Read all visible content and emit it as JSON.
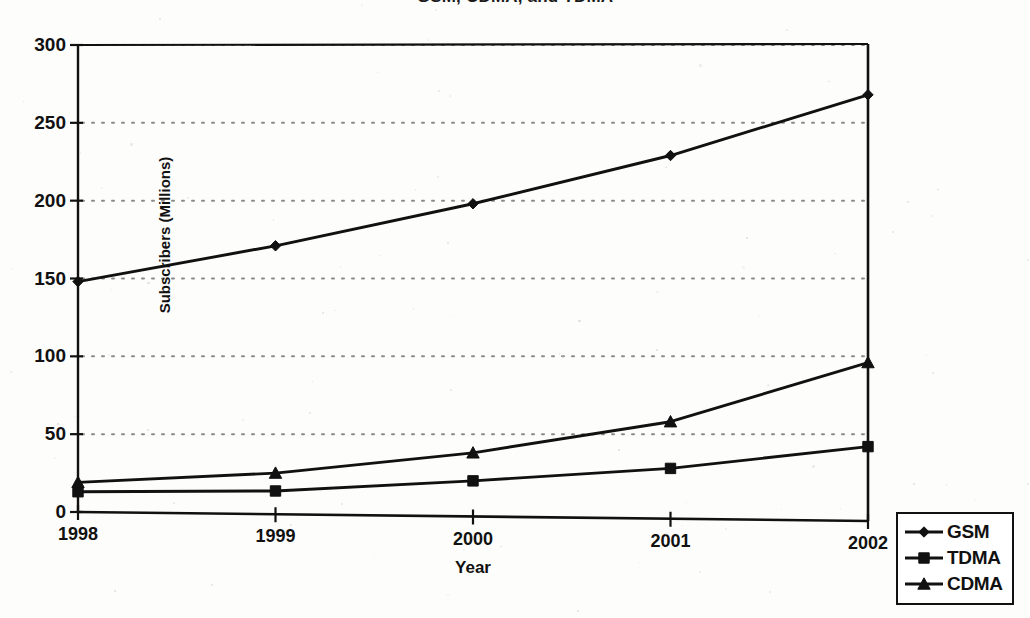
{
  "chart_data": {
    "type": "line",
    "title": "GSM, CDMA, and TDMA",
    "title_note": "clipped-top",
    "xlabel": "Year",
    "ylabel": "Subscribers (Millions)",
    "categories": [
      "1998",
      "1999",
      "2000",
      "2001",
      "2002"
    ],
    "x": [
      1998,
      1999,
      2000,
      2001,
      2002
    ],
    "xlim": [
      1998,
      2002
    ],
    "ylim": [
      0,
      300
    ],
    "yticks": [
      0,
      50,
      100,
      150,
      200,
      250,
      300
    ],
    "ytick_labels": [
      "0",
      "50",
      "100",
      "150",
      "200",
      "250",
      "300"
    ],
    "grid": "horizontal-dotted",
    "legend_position": "bottom-right-outside",
    "series": [
      {
        "name": "GSM",
        "marker": "diamond",
        "values": [
          148,
          171,
          198,
          229,
          268
        ]
      },
      {
        "name": "TDMA",
        "marker": "square",
        "values": [
          13,
          13.5,
          20,
          28,
          42
        ]
      },
      {
        "name": "CDMA",
        "marker": "triangle",
        "values": [
          19,
          25,
          38,
          58,
          96
        ]
      }
    ],
    "colors": {
      "line": "#111111",
      "grid": "#8a8a8a",
      "axis": "#111111",
      "background": "#fdfdfc"
    }
  },
  "legend": {
    "items": [
      {
        "label": "GSM",
        "marker": "diamond"
      },
      {
        "label": "TDMA",
        "marker": "square"
      },
      {
        "label": "CDMA",
        "marker": "triangle"
      }
    ]
  }
}
